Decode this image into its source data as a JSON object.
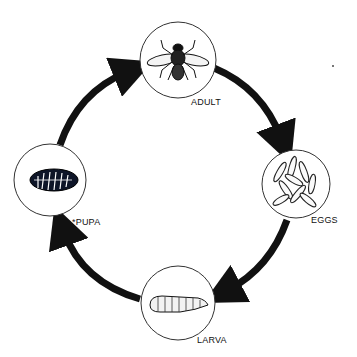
{
  "diagram": {
    "type": "life-cycle",
    "stages": [
      {
        "id": "adult",
        "label": "ADULT",
        "icon": "fly-icon"
      },
      {
        "id": "eggs",
        "label": "EGGS",
        "icon": "eggs-icon"
      },
      {
        "id": "larva",
        "label": "LARVA",
        "icon": "larva-icon"
      },
      {
        "id": "pupa",
        "label": "*PUPA",
        "icon": "pupa-icon"
      }
    ],
    "flow": [
      "adult → eggs",
      "eggs → larva",
      "larva → pupa",
      "pupa → adult"
    ],
    "colors": {
      "arrow": "#111111",
      "circle": "#333333",
      "background": "#ffffff"
    }
  }
}
